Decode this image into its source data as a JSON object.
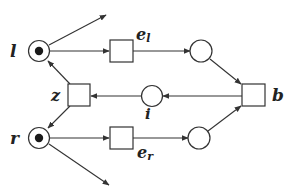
{
  "diagram": {
    "type": "petri-net",
    "colors": {
      "stroke": "#333333",
      "token": "#1a1a1a",
      "background": "#ffffff"
    },
    "places": [
      {
        "id": "l",
        "label": "l",
        "tokens": 1
      },
      {
        "id": "r",
        "label": "r",
        "tokens": 1
      },
      {
        "id": "i",
        "label": "i",
        "tokens": 0
      },
      {
        "id": "p_top",
        "label": "",
        "tokens": 0
      },
      {
        "id": "p_bottom",
        "label": "",
        "tokens": 0
      }
    ],
    "transitions": [
      {
        "id": "e_l",
        "label": "e",
        "subscript": "l"
      },
      {
        "id": "e_r",
        "label": "e",
        "subscript": "r"
      },
      {
        "id": "z",
        "label": "z"
      },
      {
        "id": "b",
        "label": "b"
      }
    ],
    "arcs": [
      {
        "from": "l",
        "to": "(out, up-right)"
      },
      {
        "from": "l",
        "to": "e_l"
      },
      {
        "from": "e_l",
        "to": "p_top"
      },
      {
        "from": "p_top",
        "to": "b"
      },
      {
        "from": "b",
        "to": "i"
      },
      {
        "from": "i",
        "to": "z"
      },
      {
        "from": "z",
        "to": "l"
      },
      {
        "from": "z",
        "to": "r"
      },
      {
        "from": "r",
        "to": "e_r"
      },
      {
        "from": "e_r",
        "to": "p_bottom"
      },
      {
        "from": "p_bottom",
        "to": "b"
      },
      {
        "from": "r",
        "to": "(out, down-right)"
      }
    ]
  },
  "labels": {
    "l": "l",
    "r": "r",
    "z": "z",
    "i": "i",
    "b": "b",
    "e_l_main": "e",
    "e_l_sub": "l",
    "e_r_main": "e",
    "e_r_sub": "r"
  }
}
